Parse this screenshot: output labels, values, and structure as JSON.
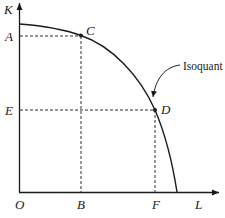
{
  "diagram": {
    "type": "isoquant",
    "axes": {
      "y_label": "K",
      "x_label": "L",
      "origin_label": "O"
    },
    "points": {
      "C": {
        "label": "C",
        "x_label": "B",
        "y_label": "A"
      },
      "D": {
        "label": "D",
        "x_label": "F",
        "y_label": "E"
      }
    },
    "curve_label": "Isoquant",
    "colors": {
      "line": "#1a1a1a",
      "background": "#ffffff"
    }
  }
}
